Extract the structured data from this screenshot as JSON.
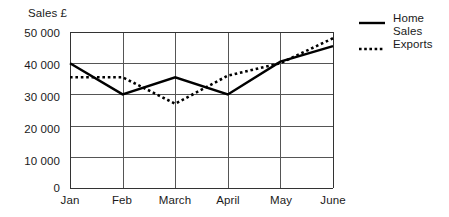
{
  "chart_data": {
    "type": "line",
    "title": "",
    "xlabel": "",
    "ylabel": "Sales £",
    "categories": [
      "Jan",
      "Feb",
      "March",
      "April",
      "May",
      "June"
    ],
    "ylim": [
      0,
      50000
    ],
    "ytick_labels": [
      "50 000",
      "40 000",
      "30 000",
      "20 000",
      "10 000",
      "0"
    ],
    "ytick_values": [
      50000,
      40000,
      30000,
      20000,
      10000,
      0
    ],
    "grid": true,
    "legend_position": "right",
    "series": [
      {
        "name": "Home\nSales",
        "style": "solid",
        "color": "#000000",
        "values": [
          40000,
          30000,
          35500,
          30000,
          40500,
          45500
        ]
      },
      {
        "name": "Exports",
        "style": "dotted",
        "color": "#000000",
        "values": [
          35500,
          35500,
          27000,
          36000,
          40000,
          48000
        ]
      }
    ]
  },
  "legend": {
    "entries": [
      {
        "label": "Home\nSales",
        "swatch": "solid-line-swatch"
      },
      {
        "label": "Exports",
        "swatch": "dotted-line-swatch"
      }
    ]
  }
}
